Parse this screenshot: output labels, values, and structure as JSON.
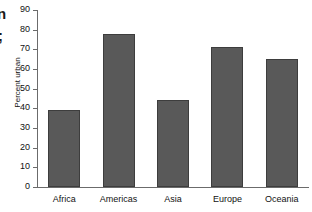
{
  "edge_fragments": {
    "top": "n",
    "bottom": ";"
  },
  "chart_data": {
    "type": "bar",
    "title": "",
    "xlabel": "",
    "ylabel": "Percent urban",
    "categories": [
      "Africa",
      "Americas",
      "Asia",
      "Europe",
      "Oceania"
    ],
    "values": [
      39,
      78,
      44,
      71,
      65
    ],
    "ylim": [
      0,
      90
    ],
    "ytick_values": [
      0,
      10,
      20,
      30,
      40,
      50,
      60,
      70,
      80,
      90
    ],
    "ytick_labels": [
      "0",
      "10",
      "20",
      "30",
      "40",
      "50",
      "60",
      "70",
      "80",
      "90"
    ],
    "grid": false,
    "legend": false,
    "bar_color": "#595959",
    "bar_edge_color": "#3d3d3d",
    "axis_color": "#6b6b6b",
    "background": "#ffffff"
  }
}
